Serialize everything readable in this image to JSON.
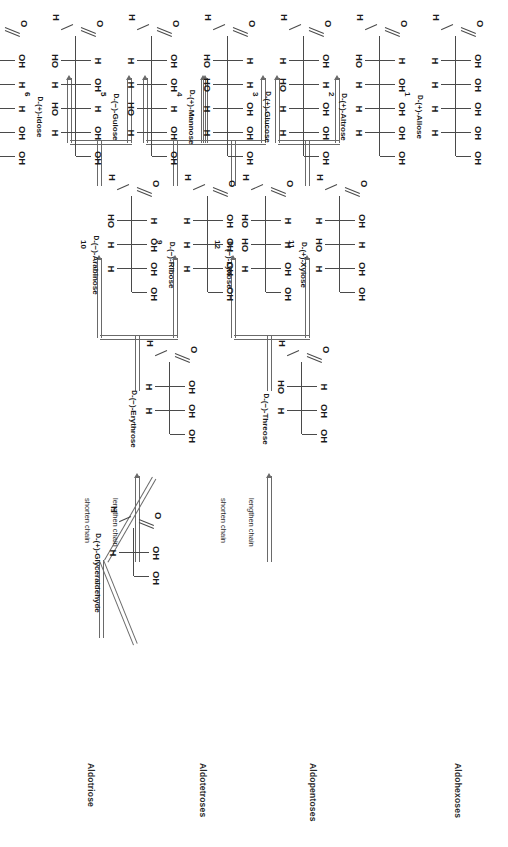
{
  "figure": {
    "type": "family-tree-diagram",
    "row_headers": [
      {
        "id": "aldohexoses",
        "label": "Aldohexoses"
      },
      {
        "id": "aldopentoses",
        "label": "Aldopentoses"
      },
      {
        "id": "aldotetroses",
        "label": "Aldotetroses"
      },
      {
        "id": "aldotriose",
        "label": "Aldotriose"
      }
    ],
    "chain_ops": {
      "lengthen": "lengthen chain",
      "shorten": "shorten chain"
    },
    "atoms": {
      "carbonyl_oxygen": "O",
      "aldehyde_hydrogen": "H",
      "hydrogen": "H",
      "hydroxyl_right": "OH",
      "hydroxyl_left": "HO"
    }
  },
  "sugars": [
    {
      "num": "1",
      "dpref": "D",
      "name": "-(+)-Allose",
      "caption": "D-(+)-Allose",
      "row": "aldohexoses",
      "carbons": 6,
      "centers": [
        "OH",
        "OH",
        "OH",
        "OH"
      ]
    },
    {
      "num": "2",
      "dpref": "D",
      "name": "-(+)-Altrose",
      "caption": "D-(+)-Altrose",
      "row": "aldohexoses",
      "carbons": 6,
      "centers": [
        "HO",
        "OH",
        "OH",
        "OH"
      ]
    },
    {
      "num": "3",
      "dpref": "D",
      "name": "-(+)-Glucose",
      "caption": "D-(+)-Glucose",
      "row": "aldohexoses",
      "carbons": 6,
      "centers": [
        "OH",
        "HO",
        "OH",
        "OH"
      ]
    },
    {
      "num": "4",
      "dpref": "D",
      "name": "-(+)-Mannose",
      "caption": "D-(+)-Mannose",
      "row": "aldohexoses",
      "carbons": 6,
      "centers": [
        "HO",
        "HO",
        "OH",
        "OH"
      ]
    },
    {
      "num": "5",
      "dpref": "D",
      "name": "-(−)-Gulose",
      "caption": "D-(−)-Gulose",
      "row": "aldohexoses",
      "carbons": 6,
      "centers": [
        "OH",
        "OH",
        "HO",
        "OH"
      ]
    },
    {
      "num": "6",
      "dpref": "D",
      "name": "-(+)-Idose",
      "caption": "D-(+)-Idose",
      "row": "aldohexoses",
      "carbons": 6,
      "centers": [
        "HO",
        "OH",
        "HO",
        "OH"
      ]
    },
    {
      "num": "7",
      "dpref": "D",
      "name": "-(+)-Galactose",
      "caption": "D-(+)-Galactose",
      "row": "aldohexoses",
      "carbons": 6,
      "centers": [
        "OH",
        "HO",
        "HO",
        "OH"
      ]
    },
    {
      "num": "8",
      "dpref": "D",
      "name": "-(+)-Talose",
      "caption": "D-(+)-Talose",
      "row": "aldohexoses",
      "carbons": 6,
      "centers": [
        "HO",
        "HO",
        "HO",
        "OH"
      ]
    },
    {
      "num": "9",
      "dpref": "D",
      "name": "-(−)-Ribose",
      "caption": "D-(−)-Ribose",
      "row": "aldopentoses",
      "carbons": 5,
      "centers": [
        "OH",
        "OH",
        "OH"
      ]
    },
    {
      "num": "10",
      "dpref": "D",
      "name": "-(−)-Arabinose",
      "caption": "D-(−)-Arabinose",
      "row": "aldopentoses",
      "carbons": 5,
      "centers": [
        "HO",
        "OH",
        "OH"
      ]
    },
    {
      "num": "11",
      "dpref": "D",
      "name": "-(+)-Xylose",
      "caption": "D-(+)-Xylose",
      "row": "aldopentoses",
      "carbons": 5,
      "centers": [
        "OH",
        "HO",
        "OH"
      ]
    },
    {
      "num": "12",
      "dpref": "D",
      "name": "-(−)-Lyxose",
      "caption": "D-(−)-Lyxose",
      "row": "aldopentoses",
      "carbons": 5,
      "centers": [
        "HO",
        "HO",
        "OH"
      ]
    },
    {
      "num": "",
      "dpref": "D",
      "name": "-(−)-Erythrose",
      "caption": "D-(−)-Erythrose",
      "row": "aldotetroses",
      "carbons": 4,
      "centers": [
        "OH",
        "OH"
      ]
    },
    {
      "num": "",
      "dpref": "D",
      "name": "-(−)-Threose",
      "caption": "D-(−)-Threose",
      "row": "aldotetroses",
      "carbons": 4,
      "centers": [
        "HO",
        "OH"
      ]
    },
    {
      "num": "",
      "dpref": "D",
      "name": "-(+)-Glyceraldehyde",
      "caption": "D-(+)-Glyceraldehyde",
      "row": "aldotriose",
      "carbons": 3,
      "centers": [
        "OH"
      ]
    }
  ],
  "colors": {
    "bond": "#4a4a4a",
    "arrow": "#6a6a6a",
    "text": "#1a1a1a",
    "background": "#ffffff"
  }
}
